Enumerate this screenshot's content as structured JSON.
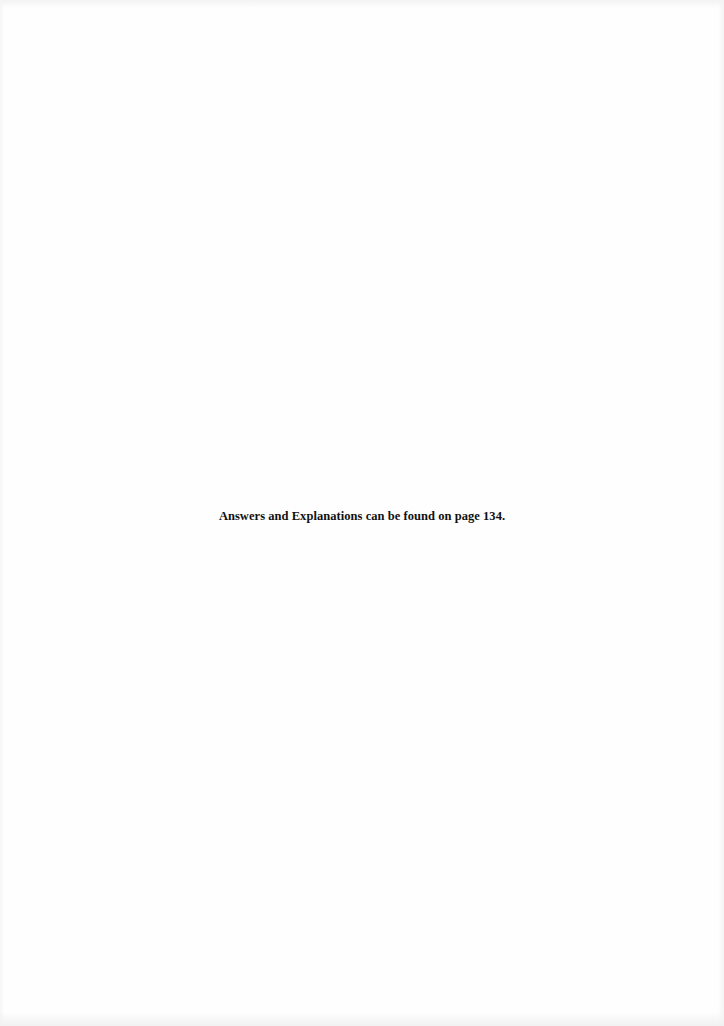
{
  "page": {
    "background_color": "#fefefe",
    "text_color": "#111111",
    "note": "Answers and Explanations can be found on page 134."
  }
}
